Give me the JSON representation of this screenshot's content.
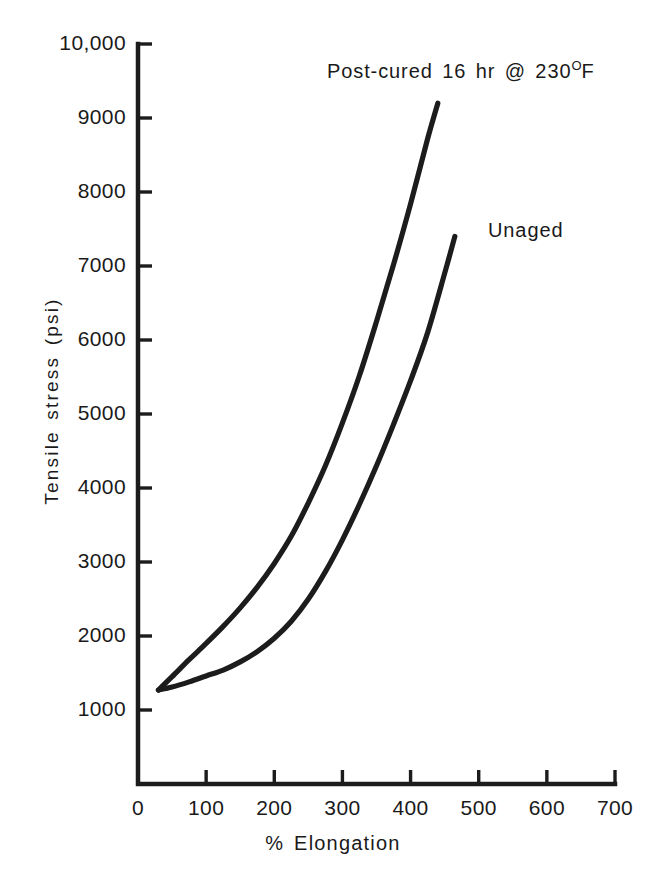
{
  "chart_data": {
    "type": "line",
    "title": "",
    "xlabel": "% Elongation",
    "ylabel": "Tensile stress (psi)",
    "xlim": [
      0,
      700
    ],
    "ylim": [
      0,
      10000
    ],
    "grid": false,
    "legend_position": "inline-annotation",
    "x_ticks": [
      {
        "value": 0,
        "label": "0"
      },
      {
        "value": 100,
        "label": "100"
      },
      {
        "value": 200,
        "label": "200"
      },
      {
        "value": 300,
        "label": "300"
      },
      {
        "value": 400,
        "label": "400"
      },
      {
        "value": 500,
        "label": "500"
      },
      {
        "value": 600,
        "label": "600"
      },
      {
        "value": 700,
        "label": "700"
      }
    ],
    "y_ticks": [
      {
        "value": 1000,
        "label": "1000"
      },
      {
        "value": 2000,
        "label": "2000"
      },
      {
        "value": 3000,
        "label": "3000"
      },
      {
        "value": 4000,
        "label": "4000"
      },
      {
        "value": 5000,
        "label": "5000"
      },
      {
        "value": 6000,
        "label": "6000"
      },
      {
        "value": 7000,
        "label": "7000"
      },
      {
        "value": 8000,
        "label": "8000"
      },
      {
        "value": 9000,
        "label": "9000"
      },
      {
        "value": 10000,
        "label": "10,000"
      }
    ],
    "series": [
      {
        "name": "Post-cured 16 hr @ 230°F",
        "annotation_label": "Post-cured 16 hr @ 230",
        "annotation_degree": "O",
        "annotation_suffix": "F",
        "color": "#1c1c1c",
        "x": [
          30,
          50,
          75,
          100,
          125,
          150,
          175,
          200,
          225,
          250,
          275,
          300,
          325,
          350,
          375,
          400,
          425,
          440
        ],
        "y": [
          1270,
          1450,
          1680,
          1900,
          2130,
          2380,
          2660,
          2980,
          3350,
          3800,
          4300,
          4880,
          5520,
          6250,
          7020,
          7840,
          8720,
          9200
        ]
      },
      {
        "name": "Unaged",
        "annotation_label": "Unaged",
        "color": "#1c1c1c",
        "x": [
          30,
          50,
          75,
          100,
          125,
          150,
          175,
          200,
          225,
          250,
          275,
          300,
          325,
          350,
          375,
          400,
          425,
          450,
          465
        ],
        "y": [
          1270,
          1310,
          1380,
          1460,
          1540,
          1650,
          1790,
          1970,
          2200,
          2500,
          2870,
          3300,
          3780,
          4300,
          4860,
          5450,
          6100,
          6900,
          7400
        ]
      }
    ]
  },
  "annotations": {
    "postcured": "Post-cured 16 hr @ 230",
    "postcured_degree": "O",
    "postcured_suffix": "F",
    "unaged": "Unaged"
  }
}
